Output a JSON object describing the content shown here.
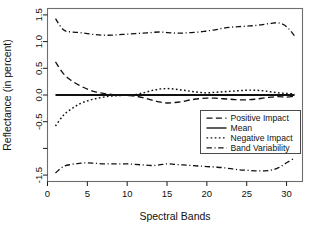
{
  "chart_data": {
    "type": "line",
    "title": "",
    "xlabel": "Spectral Bands",
    "ylabel": "Reflectance (in percent)",
    "xlim": [
      0,
      32
    ],
    "ylim": [
      -1.62,
      1.62
    ],
    "grid": false,
    "legend_position": "center-right",
    "xticks": [
      0,
      5,
      10,
      15,
      20,
      25,
      30
    ],
    "xtick_labels": [
      "0",
      "5",
      "10",
      "15",
      "20",
      "25",
      "30"
    ],
    "yticks": [
      1.5,
      1.0,
      0.5,
      0.0,
      -0.5,
      -1.0,
      -1.5
    ],
    "ytick_labels": [
      "1.5",
      "1.0",
      "0.5",
      "0.0",
      "-0.5",
      "",
      "-1.5"
    ],
    "x": [
      1,
      2,
      3,
      4,
      5,
      6,
      7,
      8,
      9,
      10,
      11,
      12,
      13,
      14,
      15,
      16,
      17,
      18,
      19,
      20,
      21,
      22,
      23,
      24,
      25,
      26,
      27,
      28,
      29,
      30,
      31
    ],
    "series": [
      {
        "name": "Positive Impact",
        "style": "dashed",
        "values": [
          0.62,
          0.4,
          0.27,
          0.18,
          0.11,
          0.06,
          0.03,
          0.01,
          0.0,
          -0.01,
          -0.02,
          -0.05,
          -0.09,
          -0.13,
          -0.15,
          -0.14,
          -0.12,
          -0.09,
          -0.07,
          -0.06,
          -0.06,
          -0.07,
          -0.08,
          -0.09,
          -0.09,
          -0.08,
          -0.06,
          -0.04,
          -0.03,
          -0.04,
          -0.02
        ]
      },
      {
        "name": "Mean",
        "style": "solid",
        "values": [
          0.0,
          0.0,
          0.0,
          0.0,
          0.0,
          0.0,
          0.0,
          0.0,
          0.0,
          0.0,
          0.0,
          0.0,
          0.0,
          0.0,
          0.0,
          0.0,
          0.0,
          0.0,
          0.0,
          0.0,
          0.0,
          0.0,
          0.0,
          0.0,
          0.0,
          0.0,
          0.0,
          0.0,
          0.0,
          0.0,
          0.0
        ]
      },
      {
        "name": "Negative Impact",
        "style": "dotted",
        "values": [
          -0.58,
          -0.38,
          -0.26,
          -0.17,
          -0.11,
          -0.07,
          -0.04,
          -0.02,
          -0.01,
          0.0,
          0.01,
          0.04,
          0.08,
          0.11,
          0.12,
          0.11,
          0.09,
          0.07,
          0.05,
          0.04,
          0.05,
          0.06,
          0.07,
          0.08,
          0.09,
          0.09,
          0.08,
          0.06,
          0.04,
          0.03,
          0.02
        ]
      },
      {
        "name": "Band Variability Upper",
        "style": "dashdot",
        "values": [
          1.43,
          1.22,
          1.18,
          1.17,
          1.15,
          1.13,
          1.12,
          1.12,
          1.13,
          1.14,
          1.15,
          1.16,
          1.17,
          1.18,
          1.17,
          1.16,
          1.16,
          1.17,
          1.18,
          1.2,
          1.22,
          1.25,
          1.27,
          1.28,
          1.29,
          1.3,
          1.32,
          1.34,
          1.35,
          1.28,
          1.11
        ]
      },
      {
        "name": "Band Variability Lower",
        "style": "dashdot",
        "values": [
          -1.46,
          -1.34,
          -1.3,
          -1.28,
          -1.27,
          -1.28,
          -1.29,
          -1.29,
          -1.29,
          -1.29,
          -1.3,
          -1.31,
          -1.32,
          -1.31,
          -1.29,
          -1.3,
          -1.31,
          -1.32,
          -1.33,
          -1.34,
          -1.35,
          -1.36,
          -1.38,
          -1.4,
          -1.41,
          -1.42,
          -1.42,
          -1.41,
          -1.36,
          -1.27,
          -1.18
        ]
      }
    ],
    "legend": [
      {
        "label": "Positive Impact",
        "style": "dashed"
      },
      {
        "label": "Mean",
        "style": "solid"
      },
      {
        "label": "Negative Impact",
        "style": "dotted"
      },
      {
        "label": "Band Variability",
        "style": "dashdot"
      }
    ]
  },
  "colors": {
    "foreground": "#111111",
    "frame": "#6e6e6e",
    "background": "#ffffff"
  }
}
